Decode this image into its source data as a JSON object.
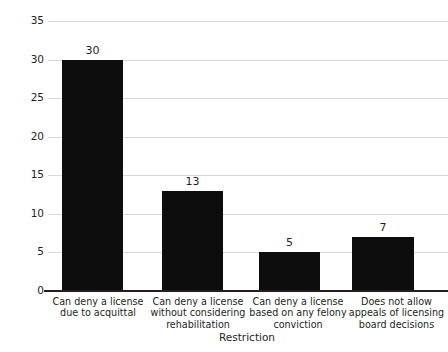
{
  "chart_data": {
    "type": "bar",
    "title": "",
    "xlabel": "Restriction",
    "ylabel": "Number of states",
    "categories": [
      "Can deny a license due to acquittal",
      "Can deny a license without considering rehabilitation",
      "Can deny a license based on any felony conviction",
      "Does not allow appeals of licensing board decisions"
    ],
    "category_lines": [
      [
        "Can deny a license",
        "due to acquittal"
      ],
      [
        "Can deny a license",
        "without considering",
        "rehabilitation"
      ],
      [
        "Can deny a license",
        "based on any felony",
        "conviction"
      ],
      [
        "Does not allow",
        "appeals of licensing",
        "board decisions"
      ]
    ],
    "values": [
      30,
      13,
      5,
      7
    ],
    "value_labels": [
      "30",
      "13",
      "5",
      "7"
    ],
    "ylim": [
      0,
      35
    ],
    "yticks": [
      0,
      5,
      10,
      15,
      20,
      25,
      30,
      35
    ],
    "ytick_labels": [
      "0",
      "5",
      "10",
      "15",
      "20",
      "25",
      "30",
      "35"
    ],
    "grid": true,
    "legend": false,
    "bar_color": "#0d0d0d",
    "grid_color": "#d8d8d8",
    "axis_color": "#231f20",
    "text_color": "#231f20",
    "background": "#ffffff"
  }
}
